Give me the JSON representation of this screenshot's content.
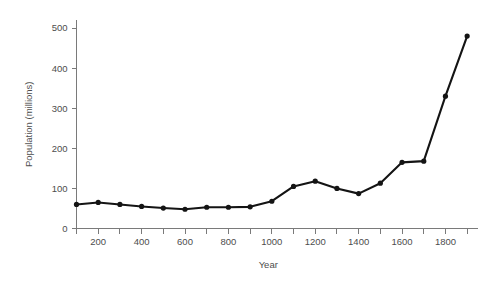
{
  "chart_data": {
    "type": "line",
    "title": "",
    "xlabel": "Year",
    "ylabel": "Population (millions)",
    "x": [
      100,
      200,
      300,
      400,
      500,
      600,
      700,
      800,
      900,
      1000,
      1100,
      1200,
      1300,
      1400,
      1500,
      1600,
      1700,
      1800,
      1900
    ],
    "values": [
      60,
      65,
      60,
      55,
      51,
      48,
      53,
      53,
      54,
      68,
      105,
      118,
      100,
      87,
      113,
      165,
      168,
      330,
      480
    ],
    "series": [
      {
        "name": "Population",
        "values": [
          60,
          65,
          60,
          55,
          51,
          48,
          53,
          53,
          54,
          68,
          105,
          118,
          100,
          87,
          113,
          165,
          168,
          330,
          480
        ]
      }
    ],
    "xlim": [
      100,
      1950
    ],
    "ylim": [
      0,
      520
    ],
    "x_tick_values": [
      100,
      200,
      300,
      400,
      500,
      600,
      700,
      800,
      900,
      1000,
      1100,
      1200,
      1300,
      1400,
      1500,
      1600,
      1700,
      1800,
      1900
    ],
    "x_tick_labels": [
      "",
      "200",
      "",
      "400",
      "",
      "600",
      "",
      "800",
      "",
      "1000",
      "",
      "1200",
      "",
      "1400",
      "",
      "1600",
      "",
      "1800",
      ""
    ],
    "y_tick_values": [
      0,
      100,
      200,
      300,
      400,
      500
    ],
    "y_tick_labels": [
      "0",
      "100",
      "200",
      "300",
      "400",
      "500"
    ],
    "grid": false,
    "legend": false,
    "legend_position": "none",
    "line_color": "#141414",
    "marker_color": "#141414",
    "axis_color": "#7a7a7a",
    "text_color": "#4d4d4d",
    "background_color": "#ffffff",
    "marker": "circle"
  }
}
